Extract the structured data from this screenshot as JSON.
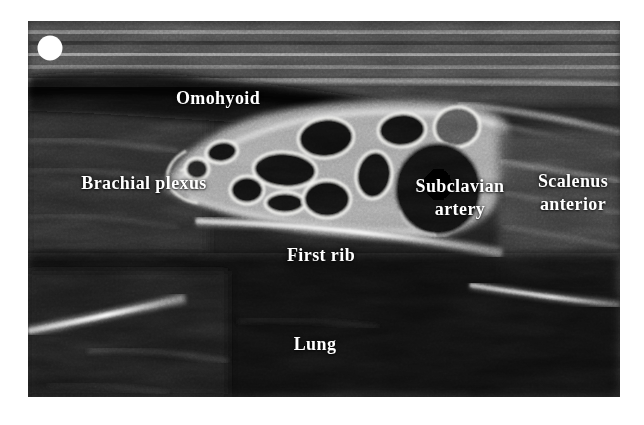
{
  "figure": {
    "kind": "annotated-ultrasound-figure",
    "description": "Supraclavicular ultrasound view of the brachial plexus",
    "labels": {
      "omohyoid": "Omohyoid",
      "brachial_plexus": "Brachial plexus",
      "subclavian_line1": "Subclavian",
      "subclavian_line2": "artery",
      "scalenus_line1": "Scalenus",
      "scalenus_line2": "anterior",
      "first_rib": "First rib",
      "lung": "Lung"
    },
    "colors": {
      "page_bg": "#ffffff",
      "label_text": "#ffffff",
      "echo_bright": "#f0f0f0",
      "tissue_mid": "#4a4a4a",
      "tissue_dark": "#0d0d0d",
      "ring_outline": "#f2f2ee",
      "marker_dot": "#ffffff"
    }
  }
}
